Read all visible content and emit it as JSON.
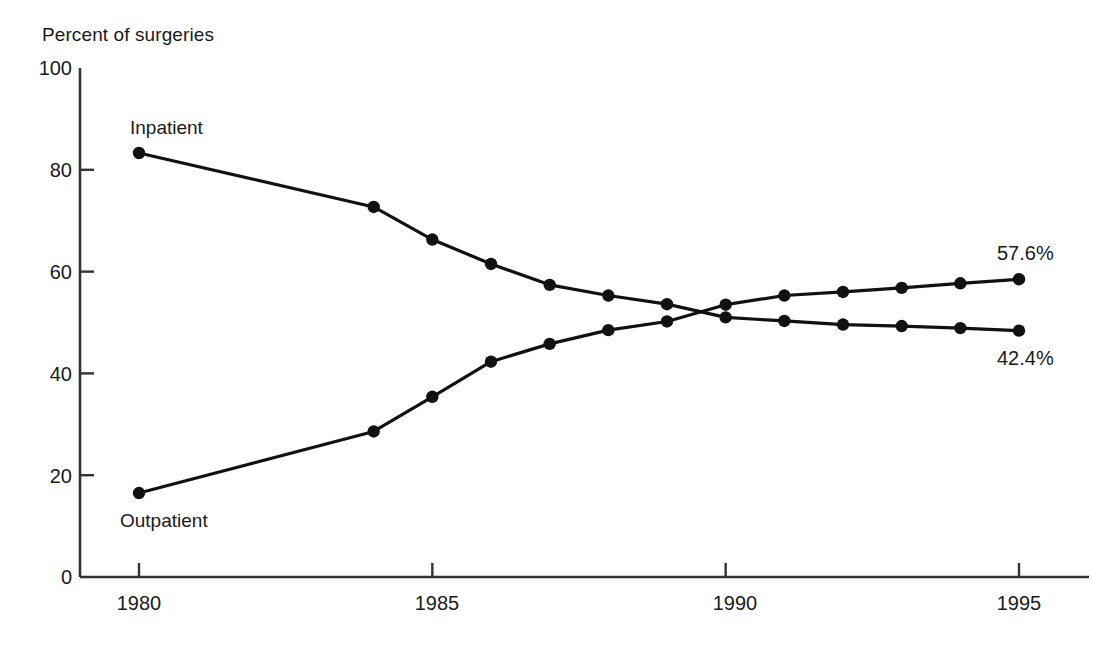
{
  "chart_data": {
    "type": "line",
    "title": "Percent of surgeries",
    "xlabel": "",
    "ylabel": "Percent of surgeries",
    "xlim": [
      1979.2,
      1996.0
    ],
    "ylim": [
      0,
      100
    ],
    "grid": false,
    "legend_position": "inline-labels",
    "x_ticks": [
      "1980",
      "1985",
      "1990",
      "1995"
    ],
    "x_tick_values": [
      1980,
      1985,
      1990,
      1995
    ],
    "y_ticks": [
      "0",
      "20",
      "40",
      "60",
      "80",
      "100"
    ],
    "y_tick_values": [
      0,
      20,
      40,
      60,
      80,
      100
    ],
    "x": [
      1980,
      1984,
      1985,
      1986,
      1987,
      1988,
      1989,
      1990,
      1991,
      1992,
      1993,
      1994,
      1995
    ],
    "series": [
      {
        "name": "Inpatient",
        "values": [
          83.3,
          72.7,
          66.3,
          61.5,
          57.4,
          55.3,
          53.6,
          51.0,
          50.3,
          49.6,
          49.3,
          48.9,
          48.4
        ],
        "end_label": "42.4%",
        "marker": "filled-circle",
        "color": "#111111"
      },
      {
        "name": "Outpatient",
        "values": [
          16.5,
          28.6,
          35.4,
          42.3,
          45.8,
          48.5,
          50.2,
          53.5,
          55.3,
          56.0,
          56.8,
          57.7,
          58.5
        ],
        "end_label": "57.6%",
        "marker": "filled-circle",
        "color": "#111111"
      }
    ],
    "annotations": [
      {
        "text": "Inpatient",
        "x": 1980.0,
        "y": 89.0,
        "name": "inpatient-series-label"
      },
      {
        "text": "Outpatient",
        "x": 1980.0,
        "y": 11.0,
        "name": "outpatient-series-label"
      },
      {
        "text": "57.6%",
        "x": 1995.0,
        "y": 63.0,
        "name": "outpatient-end-label"
      },
      {
        "text": "42.4%",
        "x": 1995.0,
        "y": 41.5,
        "name": "inpatient-end-label"
      }
    ]
  },
  "labels": {
    "axis_title": "Percent of surgeries",
    "inpatient": "Inpatient",
    "outpatient": "Outpatient",
    "outpatient_end": "57.6%",
    "inpatient_end": "42.4%",
    "y0": "0",
    "y20": "20",
    "y40": "40",
    "y60": "60",
    "y80": "80",
    "y100": "100",
    "x1980": "1980",
    "x1985": "1985",
    "x1990": "1990",
    "x1995": "1995"
  },
  "colors": {
    "ink": "#111111",
    "axis": "#333333",
    "background": "#ffffff"
  }
}
